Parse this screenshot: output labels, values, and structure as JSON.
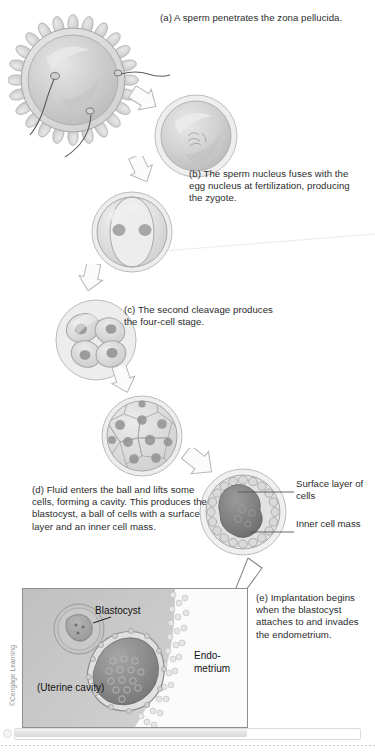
{
  "figure": {
    "credit": "©Cengage Learning",
    "background_color": "#ffffff",
    "ink_color": "#2b2b2b"
  },
  "captions": [
    {
      "id": "a",
      "text": "(a) A sperm penetrates the zona pellucida.",
      "stage": "fertilization"
    },
    {
      "id": "b",
      "text": "(b) The sperm nucleus fuses with the egg nucleus at fertilization, producing the zygote.",
      "stage": "zygote"
    },
    {
      "id": "c",
      "text": "(c) The second cleavage produces the four-cell stage.",
      "stage": "four-cell"
    },
    {
      "id": "d",
      "text": "(d) Fluid enters the ball and lifts some cells, forming a cavity. This produces the blastocyst, a ball of cells with a surface layer and an inner cell mass.",
      "stage": "blastocyst"
    },
    {
      "id": "e",
      "text": "(e) Implantation begins when the blastocyst attaches to and invades the endometrium.",
      "stage": "implantation"
    }
  ],
  "leader_labels": {
    "surface_layer": "Surface layer of cells",
    "inner_cell_mass": "Inner cell mass"
  },
  "implantation_panel": {
    "blastocyst_label": "Blastocyst",
    "endometrium_label": "Endo- metrium",
    "uterine_cavity_label": "(Uterine cavity)"
  },
  "stages": [
    {
      "name": "egg-with-sperm",
      "cells": 1,
      "label": "egg surrounded by corona radiata cells, two sperm approaching"
    },
    {
      "name": "zygote",
      "cells": 1,
      "label": "fertilized egg / zygote"
    },
    {
      "name": "two-cell",
      "cells": 2,
      "label": "two-cell stage after first cleavage"
    },
    {
      "name": "four-cell",
      "cells": 4,
      "label": "four-cell stage after second cleavage"
    },
    {
      "name": "morula",
      "cells": 16,
      "label": "solid ball of cells (morula)"
    },
    {
      "name": "blastocyst",
      "cells": 0,
      "label": "blastocyst with cavity, surface layer and inner cell mass"
    }
  ],
  "colors": {
    "cell_fill": "#d5d5d5",
    "cell_fill_light": "#e3e3e3",
    "cell_outline": "#9b9b9b",
    "nucleus": "#8e8e8e",
    "arrow_stroke": "#b6b6b6",
    "panel_bg": "#c9c9c9",
    "panel_border": "#8f8f8f",
    "endometrium": "#efefef"
  }
}
